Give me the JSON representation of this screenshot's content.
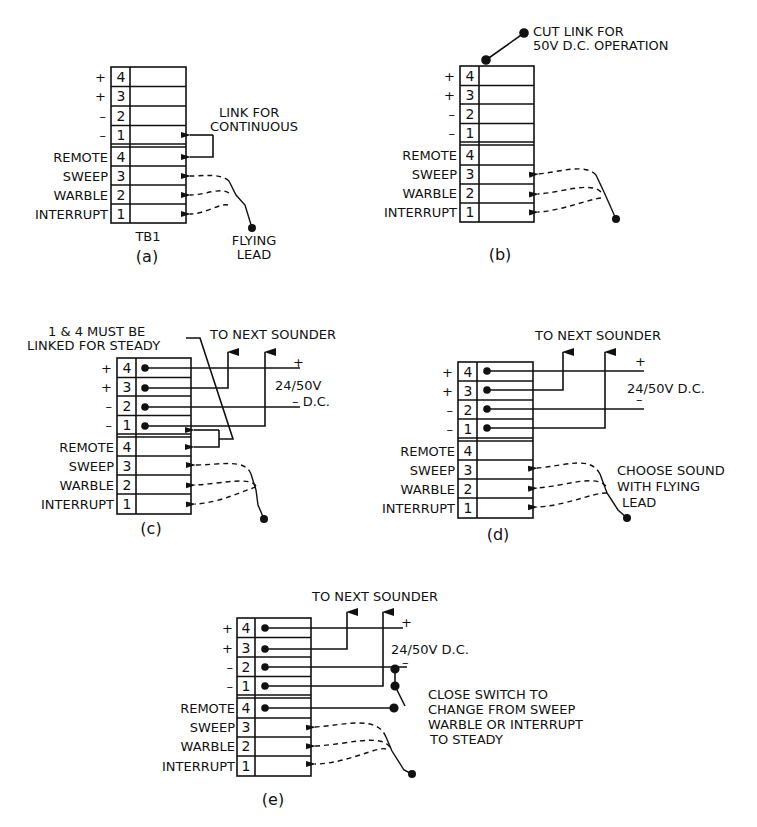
{
  "figure": {
    "terminal_labels": {
      "upper": [
        "+",
        "+",
        "–",
        "–"
      ],
      "lower": [
        "REMOTE",
        "SWEEP",
        "WARBLE",
        "INTERRUPT"
      ],
      "upper_numbers": [
        "4",
        "3",
        "2",
        "1"
      ],
      "lower_numbers": [
        "4",
        "3",
        "2",
        "1"
      ]
    },
    "panels": [
      {
        "id": "a",
        "caption": "(a)",
        "block_label": "TB1",
        "notes": [
          "LINK FOR",
          "CONTINUOUS"
        ],
        "flying_lead_label": [
          "FLYING",
          "LEAD"
        ]
      },
      {
        "id": "b",
        "caption": "(b)",
        "notes": [
          "CUT LINK FOR",
          "50V D.C. OPERATION"
        ]
      },
      {
        "id": "c",
        "caption": "(c)",
        "notes": [
          "1 & 4 MUST BE",
          "LINKED FOR STEADY"
        ],
        "to_next": "TO NEXT SOUNDER",
        "supply": [
          "+",
          "24/50V",
          "–  D.C."
        ]
      },
      {
        "id": "d",
        "caption": "(d)",
        "to_next": "TO NEXT SOUNDER",
        "supply": [
          "+",
          "24/50V D.C.",
          "–"
        ],
        "notes": [
          "CHOOSE SOUND",
          "WITH FLYING",
          "LEAD"
        ]
      },
      {
        "id": "e",
        "caption": "(e)",
        "to_next": "TO NEXT SOUNDER",
        "supply": [
          "+",
          "24/50V D.C.",
          "–"
        ],
        "notes": [
          "CLOSE SWITCH TO",
          "CHANGE FROM SWEEP",
          "WARBLE  OR INTERRUPT",
          "TO STEADY"
        ]
      }
    ]
  }
}
